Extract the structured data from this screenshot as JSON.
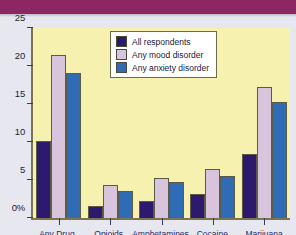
{
  "banner": {
    "color": "#8d2663"
  },
  "legend": {
    "items": [
      {
        "label": "All respondents",
        "color": "#2d1a6e"
      },
      {
        "label": "Any mood disorder",
        "color": "#d9c4de"
      },
      {
        "label": "Any anxiety disorder",
        "color": "#2f6cb5"
      }
    ]
  },
  "chart_data": {
    "type": "bar",
    "title": "",
    "xlabel": "",
    "ylabel": "",
    "ylim": [
      0,
      25
    ],
    "yticks": [
      0,
      5,
      10,
      15,
      20,
      25
    ],
    "ytick_labels": [
      "0%",
      "5",
      "10",
      "15",
      "20",
      "25"
    ],
    "grid": false,
    "legend_position": "top-center",
    "plot_background": "#f6f1ae",
    "categories": [
      "Any Drug",
      "Opioids",
      "Amphetamines",
      "Cocaine",
      "Marijuana"
    ],
    "series": [
      {
        "name": "All respondents",
        "color": "#2d1a6e",
        "values": [
          10.1,
          1.6,
          2.3,
          3.1,
          8.4
        ]
      },
      {
        "name": "Any mood disorder",
        "color": "#d9c4de",
        "values": [
          21.5,
          4.3,
          5.2,
          6.5,
          17.2
        ]
      },
      {
        "name": "Any anxiety disorder",
        "color": "#2f6cb5",
        "values": [
          19.1,
          3.5,
          4.8,
          5.5,
          15.3
        ]
      }
    ]
  }
}
